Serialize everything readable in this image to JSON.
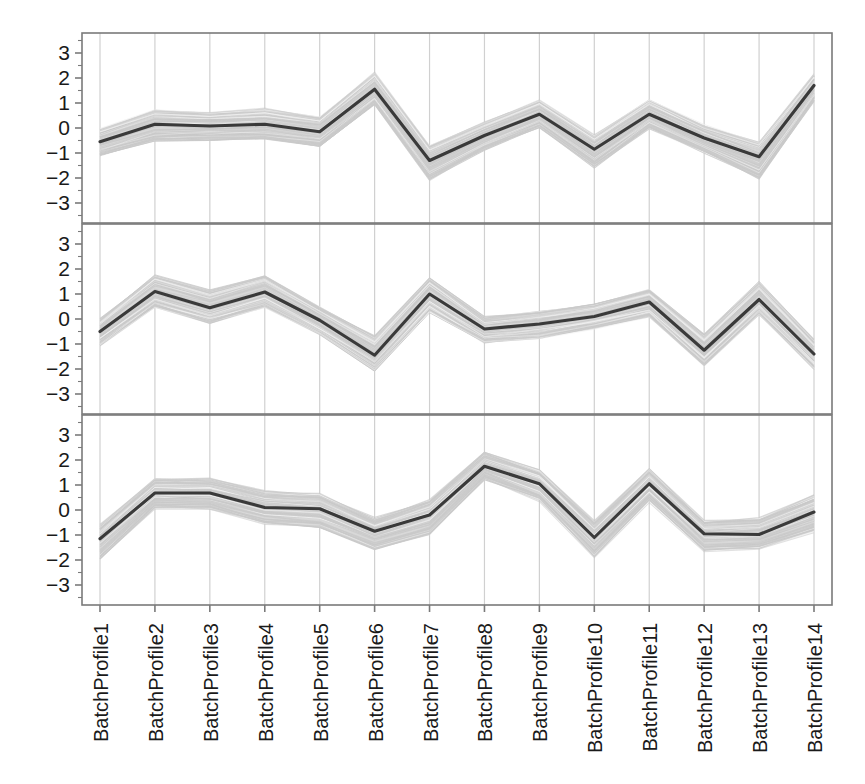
{
  "chart_data": {
    "type": "line",
    "title": "",
    "subtitle": "",
    "xlabel": "",
    "ylabel": "",
    "grid": true,
    "legend": null,
    "layout": "3 stacked panels sharing one x axis",
    "x": [
      "BatchProfile1",
      "BatchProfile2",
      "BatchProfile3",
      "BatchProfile4",
      "BatchProfile5",
      "BatchProfile6",
      "BatchProfile7",
      "BatchProfile8",
      "BatchProfile9",
      "BatchProfile10",
      "BatchProfile11",
      "BatchProfile12",
      "BatchProfile13",
      "BatchProfile14"
    ],
    "categories": [
      "BatchProfile1",
      "BatchProfile2",
      "BatchProfile3",
      "BatchProfile4",
      "BatchProfile5",
      "BatchProfile6",
      "BatchProfile7",
      "BatchProfile8",
      "BatchProfile9",
      "BatchProfile10",
      "BatchProfile11",
      "BatchProfile12",
      "BatchProfile13",
      "BatchProfile14"
    ],
    "ylim": [
      -3.5,
      3.5
    ],
    "yticks": [
      3,
      2,
      1,
      0,
      -1,
      -2,
      -3
    ],
    "ytick_labels": [
      "3",
      "2",
      "1",
      "0",
      "-1",
      "-2",
      "-3"
    ],
    "colors": {
      "mean_line": "#3a3a3a",
      "band": "#d6d6d6",
      "band_line": "#c9c9c9",
      "grid": "#d0d0d0",
      "axis": "#7a7a7a",
      "text": "#1a1a1a",
      "background": "#ffffff"
    },
    "panels": [
      {
        "name": "panel-1",
        "index": 1,
        "series": [
          {
            "name": "mean",
            "style": "dark-line",
            "values": [
              -0.55,
              0.15,
              0.08,
              0.15,
              -0.15,
              1.55,
              -1.3,
              -0.3,
              0.55,
              -0.85,
              0.55,
              -0.4,
              -1.15,
              1.7
            ]
          },
          {
            "name": "band-upper",
            "style": "gray-envelope",
            "values": [
              -0.05,
              0.72,
              0.62,
              0.78,
              0.45,
              2.2,
              -0.7,
              0.25,
              1.1,
              -0.28,
              1.15,
              0.1,
              -0.55,
              2.2
            ]
          },
          {
            "name": "band-lower",
            "style": "gray-envelope",
            "values": [
              -1.1,
              -0.5,
              -0.45,
              -0.45,
              -0.75,
              0.95,
              -2.05,
              -0.85,
              0.05,
              -1.55,
              0.0,
              -0.95,
              -2.0,
              1.1
            ]
          }
        ]
      },
      {
        "name": "panel-2",
        "index": 2,
        "series": [
          {
            "name": "mean",
            "style": "dark-line",
            "values": [
              -0.5,
              1.1,
              0.45,
              1.08,
              -0.05,
              -1.45,
              1.0,
              -0.4,
              -0.2,
              0.1,
              0.68,
              -1.25,
              0.78,
              -1.4
            ]
          },
          {
            "name": "band-upper",
            "style": "gray-envelope",
            "values": [
              0.0,
              1.75,
              1.15,
              1.75,
              0.5,
              -0.7,
              1.65,
              0.05,
              0.3,
              0.6,
              1.2,
              -0.6,
              1.45,
              -0.85
            ]
          },
          {
            "name": "band-lower",
            "style": "gray-envelope",
            "values": [
              -1.1,
              0.45,
              -0.2,
              0.45,
              -0.65,
              -2.1,
              0.3,
              -0.95,
              -0.75,
              -0.4,
              0.1,
              -1.9,
              0.15,
              -2.0
            ]
          }
        ]
      },
      {
        "name": "panel-3",
        "index": 3,
        "series": [
          {
            "name": "mean",
            "style": "dark-line",
            "values": [
              -1.15,
              0.68,
              0.68,
              0.1,
              0.05,
              -0.85,
              -0.2,
              1.75,
              1.05,
              -1.1,
              1.05,
              -0.95,
              -0.98,
              -0.08
            ]
          },
          {
            "name": "band-upper",
            "style": "gray-envelope",
            "values": [
              -0.6,
              1.25,
              1.25,
              0.75,
              0.65,
              -0.35,
              0.4,
              2.3,
              1.6,
              -0.45,
              1.65,
              -0.45,
              -0.35,
              0.55
            ]
          },
          {
            "name": "band-lower",
            "style": "gray-envelope",
            "values": [
              -1.95,
              0.1,
              0.05,
              -0.55,
              -0.7,
              -1.55,
              -0.95,
              1.25,
              0.4,
              -1.85,
              0.35,
              -1.6,
              -1.55,
              -0.85
            ]
          }
        ]
      }
    ]
  },
  "geometry": {
    "plot_left": 82,
    "plot_right": 832,
    "panel_tops": [
      33,
      224,
      415
    ],
    "panel_height": 190,
    "unit_px": 25
  }
}
